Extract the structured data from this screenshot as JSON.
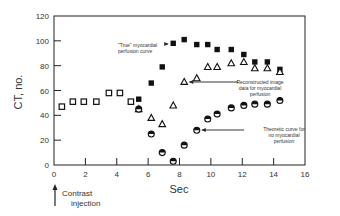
{
  "chart_data": {
    "type": "scatter",
    "title": "",
    "xlabel": "Sec",
    "ylabel": "CT, no.",
    "xlim": [
      0,
      16
    ],
    "ylim": [
      0,
      120
    ],
    "xticks": [
      0,
      2,
      4,
      6,
      8,
      10,
      12,
      14,
      16
    ],
    "yticks": [
      0,
      20,
      40,
      60,
      80,
      100,
      120
    ],
    "grid": false,
    "legend": "none (inline annotations with arrows)",
    "series": [
      {
        "name": "Baseline (pre-contrast)",
        "marker": "open-square",
        "x": [
          0.5,
          1.2,
          1.9,
          2.7,
          3.5,
          4.2,
          4.9
        ],
        "values": [
          47,
          51,
          51,
          51,
          58,
          58,
          51
        ]
      },
      {
        "name": "\"True\" myocardial perfusion curve",
        "marker": "filled-square",
        "x": [
          5.4,
          6.2,
          6.9,
          7.6,
          8.3,
          9.1,
          9.8,
          10.4,
          11.3,
          12.1,
          12.8,
          13.6,
          14.4
        ],
        "values": [
          53,
          66,
          79,
          98,
          101,
          97,
          97,
          93,
          93,
          89,
          83,
          83,
          77
        ]
      },
      {
        "name": "Reconstructed image data for myocardial perfusion",
        "marker": "open-triangle",
        "x": [
          5.4,
          6.2,
          6.9,
          7.6,
          8.3,
          9.1,
          9.8,
          10.4,
          11.3,
          12.1,
          12.8,
          13.6,
          14.4
        ],
        "values": [
          45,
          38,
          33,
          48,
          67,
          70,
          79,
          79,
          82,
          83,
          78,
          78,
          75
        ]
      },
      {
        "name": "Theoretic curve for no myocardial perfusion",
        "marker": "half-filled-circle",
        "x": [
          5.4,
          6.2,
          6.9,
          7.6,
          8.3,
          9.1,
          9.8,
          10.4,
          11.3,
          12.1,
          12.8,
          13.6,
          14.4
        ],
        "values": [
          45,
          25,
          10,
          3,
          16,
          28,
          37,
          41,
          46,
          48,
          49,
          49,
          52
        ]
      }
    ],
    "annotations": [
      {
        "text": "\"True\" myocardial perfusion curve",
        "lines": [
          "\"True\" myocardial",
          "perfusion curve"
        ],
        "arrow_to": [
          7.6,
          98
        ]
      },
      {
        "text": "Reconstructed image data for myocardial perfusion",
        "lines": [
          "Reconstructed image",
          "data for myocardial",
          "perfusion"
        ],
        "arrow_to": [
          8.3,
          67
        ]
      },
      {
        "text": "Theoretic curve for no myocardial perfusion",
        "lines": [
          "Theoretic curve for",
          "no myocardial",
          "perfusion"
        ],
        "arrow_to": [
          9.1,
          28
        ]
      },
      {
        "text": "Contrast injection",
        "lines": [
          "Contrast",
          "injection"
        ],
        "arrow_at_x": 0
      }
    ]
  },
  "labels": {
    "ylabel": "CT, no.",
    "xlabel": "Sec",
    "contrast_line1": "Contrast",
    "contrast_line2": "injection"
  }
}
